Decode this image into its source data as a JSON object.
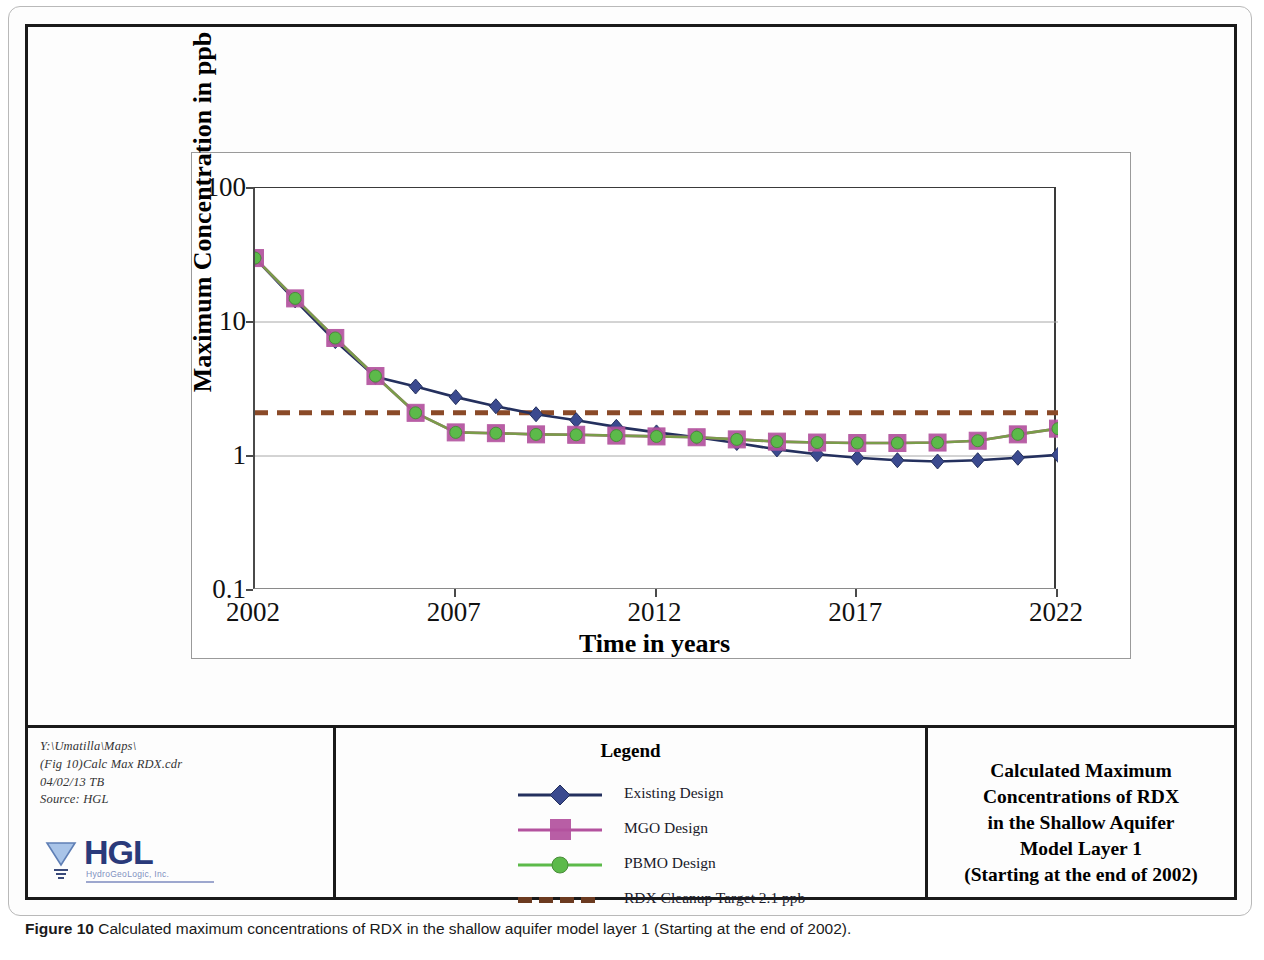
{
  "chart_data": {
    "type": "line",
    "title": "Calculated Maximum Concentrations of RDX in the Shallow Aquifer Model Layer 1 (Starting at the end of 2002)",
    "xlabel": "Time in years",
    "ylabel": "Maximum Concentration in ppb",
    "yscale": "log",
    "ylim": [
      0.1,
      100
    ],
    "xlim": [
      2002,
      2022
    ],
    "ytick_labels": [
      "100",
      "10",
      "1",
      "0.1"
    ],
    "ytick_values": [
      100,
      10,
      1,
      0.1
    ],
    "xtick_labels": [
      "2002",
      "2007",
      "2012",
      "2017",
      "2022"
    ],
    "xtick_values": [
      2002,
      2007,
      2012,
      2017,
      2022
    ],
    "grid": "horizontal",
    "legend_position": "bottom-center",
    "x": [
      2002,
      2003,
      2004,
      2005,
      2006,
      2007,
      2008,
      2009,
      2010,
      2011,
      2012,
      2013,
      2014,
      2015,
      2016,
      2017,
      2018,
      2019,
      2020,
      2021,
      2022
    ],
    "series": [
      {
        "name": "Existing Design",
        "color": "#3b4a8f",
        "line_color": "#24305e",
        "marker": "diamond",
        "values": [
          30,
          14.5,
          7.2,
          3.9,
          3.3,
          2.75,
          2.35,
          2.05,
          1.85,
          1.65,
          1.5,
          1.38,
          1.25,
          1.12,
          1.03,
          0.97,
          0.93,
          0.91,
          0.93,
          0.97,
          1.02
        ]
      },
      {
        "name": "MGO Design",
        "color": "#b3529e",
        "line_color": "#b3529e",
        "marker": "square",
        "values": [
          30,
          15,
          7.6,
          3.95,
          2.1,
          1.5,
          1.48,
          1.45,
          1.44,
          1.42,
          1.4,
          1.38,
          1.33,
          1.28,
          1.26,
          1.25,
          1.25,
          1.26,
          1.3,
          1.45,
          1.6
        ]
      },
      {
        "name": "PBMO Design",
        "color": "#5cba4a",
        "line_color": "#7a9c4a",
        "marker": "circle",
        "values": [
          30,
          15,
          7.6,
          3.95,
          2.1,
          1.5,
          1.48,
          1.45,
          1.44,
          1.42,
          1.4,
          1.38,
          1.33,
          1.28,
          1.26,
          1.25,
          1.25,
          1.26,
          1.3,
          1.45,
          1.6
        ]
      }
    ],
    "threshold": {
      "name": "RDX Cleanup Target 2.1 ppb",
      "value": 2.1,
      "color": "#8a4a28",
      "style": "dashed"
    },
    "legend_entries": [
      {
        "label": "Existing Design",
        "marker": "diamond",
        "color": "#3b4a8f",
        "line_color": "#24305e"
      },
      {
        "label": "MGO Design",
        "marker": "square",
        "color": "#b3529e",
        "line_color": "#b3529e"
      },
      {
        "label": "PBMO Design",
        "marker": "circle",
        "color": "#5cba4a",
        "line_color": "#5cba4a"
      },
      {
        "label": "RDX Cleanup Target 2.1 ppb",
        "marker": "dashed-line",
        "color": "#6b3a20",
        "line_color": "#6b3a20"
      }
    ]
  },
  "legend": {
    "heading": "Legend"
  },
  "titleblock": {
    "filepath": {
      "line1": "Y:\\Umatilla\\Maps\\",
      "line2": "(Fig 10)Calc  Max  RDX.cdr",
      "line3": "04/02/13 TB",
      "line4": "Source: HGL"
    },
    "logo": {
      "wordmark": "HGL",
      "tagline": "HydroGeoLogic, Inc."
    },
    "title_lines": [
      "Calculated Maximum",
      "Concentrations of RDX",
      "in the Shallow Aquifer",
      "Model Layer 1",
      "(Starting at the end of 2002)"
    ]
  },
  "caption": {
    "label": "Figure 10",
    "text": " Calculated maximum concentrations of RDX in the shallow aquifer model layer 1 (Starting at the end of 2002)."
  }
}
